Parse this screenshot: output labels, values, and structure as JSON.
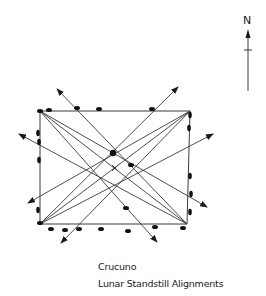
{
  "diagram": {
    "title": "Crucuno",
    "subtitle": "Lunar Standstill Alignments",
    "north_label": "N",
    "colors": {
      "line": "#3a3a3a",
      "stone": "#111111",
      "background": "#ffffff"
    },
    "rectangle": {
      "top_left": [
        40,
        111
      ],
      "top_right": [
        190,
        111
      ],
      "bottom_right": [
        187,
        224
      ],
      "bottom_left": [
        40,
        224
      ]
    },
    "center_mark": {
      "symbol": "x",
      "position": [
        115,
        168
      ]
    },
    "central_stone": [
      113,
      153
    ],
    "alignment_arrows": [
      {
        "from": [
          187,
          224
        ],
        "to": [
          57,
          89
        ]
      },
      {
        "from": [
          40,
          224
        ],
        "to": [
          178,
          87
        ]
      },
      {
        "from": [
          187,
          224
        ],
        "to": [
          19,
          134
        ]
      },
      {
        "from": [
          40,
          224
        ],
        "to": [
          213,
          134
        ]
      },
      {
        "from": [
          190,
          111
        ],
        "to": [
          28,
          203
        ]
      },
      {
        "from": [
          190,
          111
        ],
        "to": [
          61,
          243
        ]
      },
      {
        "from": [
          40,
          111
        ],
        "to": [
          207,
          207
        ]
      },
      {
        "from": [
          40,
          111
        ],
        "to": [
          157,
          242
        ]
      }
    ],
    "stones": [
      [
        40,
        111
      ],
      [
        49,
        110
      ],
      [
        77,
        108
      ],
      [
        99,
        109
      ],
      [
        152,
        109
      ],
      [
        190,
        115
      ],
      [
        189,
        128
      ],
      [
        38,
        133
      ],
      [
        39,
        142
      ],
      [
        39,
        160
      ],
      [
        190,
        176
      ],
      [
        191,
        194
      ],
      [
        190,
        212
      ],
      [
        38,
        210
      ],
      [
        40,
        223
      ],
      [
        51,
        229
      ],
      [
        65,
        230
      ],
      [
        79,
        229
      ],
      [
        101,
        229
      ],
      [
        128,
        231
      ],
      [
        155,
        227
      ],
      [
        183,
        228
      ],
      [
        131,
        165
      ],
      [
        126,
        208
      ]
    ]
  }
}
